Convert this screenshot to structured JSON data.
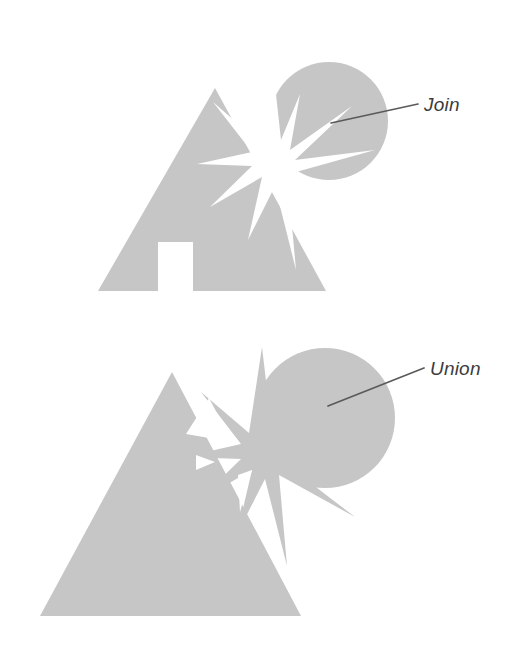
{
  "page": {
    "background_color": "#ffffff",
    "width": 513,
    "height": 653
  },
  "style": {
    "shape_fill": "#c6c6c6",
    "shape_fill_alt": "#c9c9c9",
    "leader_color": "#5a5a5a",
    "label_color": "#3c3c3c",
    "knockout_color": "#ffffff"
  },
  "figures": [
    {
      "id": "join-figure",
      "operation": "Join",
      "label": "Join",
      "label_x": 424,
      "label_y": 111,
      "leader_from_x": 331,
      "leader_from_y": 123,
      "leader_to_x": 418,
      "leader_to_y": 104,
      "description": "Triangle with rectangular door opening, overlapped by a starburst that is knocked out of both the triangle and the circle",
      "shapes": [
        {
          "name": "triangle",
          "apex_x": 215,
          "apex_y": 88,
          "base_left_x": 98,
          "base_right_x": 326,
          "base_y": 291
        },
        {
          "name": "door-cutout",
          "x": 158,
          "y": 242,
          "width": 35,
          "height": 50
        },
        {
          "name": "circle",
          "cx": 329,
          "cy": 121,
          "r": 59
        },
        {
          "name": "starburst",
          "cx": 272,
          "cy": 162,
          "points": 9,
          "knockout": true
        }
      ]
    },
    {
      "id": "union-figure",
      "operation": "Union",
      "label": "Union",
      "label_x": 430,
      "label_y": 375,
      "leader_from_x": 328,
      "leader_from_y": 406,
      "leader_to_x": 424,
      "leader_to_y": 368,
      "description": "Triangle, circle and starburst merged into one filled silhouette with small residual holes",
      "shapes": [
        {
          "name": "triangle",
          "apex_x": 172,
          "apex_y": 372,
          "base_left_x": 40,
          "base_right_x": 301,
          "base_y": 616
        },
        {
          "name": "circle",
          "cx": 325,
          "cy": 418,
          "r": 70
        },
        {
          "name": "starburst",
          "cx": 262,
          "cy": 455,
          "points": 9,
          "knockout": false
        }
      ]
    }
  ]
}
